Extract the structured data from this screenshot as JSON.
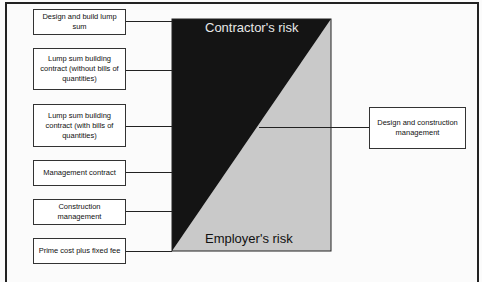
{
  "diagram": {
    "regions": {
      "contractor": {
        "label": "Contractor's risk",
        "color": "#111111"
      },
      "employer": {
        "label": "Employer's risk",
        "color": "#c8c8c8"
      }
    },
    "left_boxes": [
      {
        "label": "Design and build lump sum"
      },
      {
        "label": "Lump sum building contract (without bills of quantities)"
      },
      {
        "label": "Lump sum building contract (with bills of quantities)"
      },
      {
        "label": "Management contract"
      },
      {
        "label": "Construction management"
      },
      {
        "label": "Prime cost plus fixed fee"
      }
    ],
    "right_box": {
      "label": "Design and construction management"
    }
  }
}
